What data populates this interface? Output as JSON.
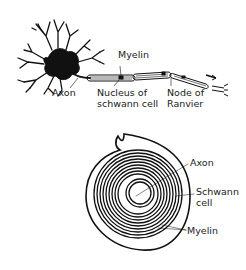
{
  "figure_top": {
    "title": "Myelinated neuron",
    "labels": {
      "myelin": "Myelin",
      "axon": "Axon",
      "nucleus_line1": "Nucleus of",
      "nucleus_line2": "schwann cell",
      "node_line1": "Node of",
      "node_line2": "Ranvier"
    }
  },
  "figure_bottom": {
    "title": "Myelin sheath cross-section",
    "labels": {
      "axon": "Axon",
      "schwann_line1": "Schwann",
      "schwann_line2": "cell",
      "myelin": "Myelin"
    }
  },
  "colors": {
    "ink": "#111111",
    "background": "#ffffff"
  }
}
